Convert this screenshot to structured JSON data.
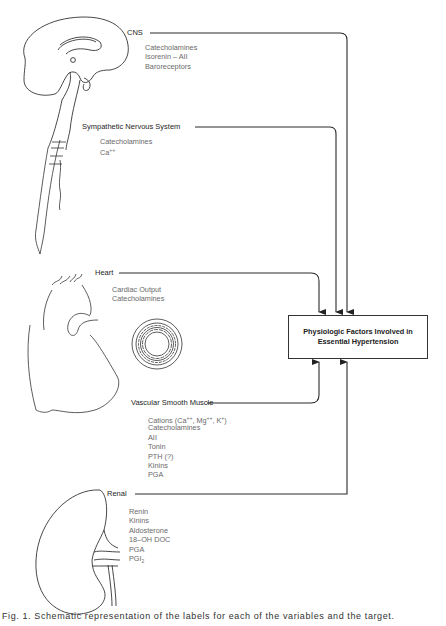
{
  "diagram": {
    "target": {
      "line1": "Physiologic Factors Involved in",
      "line2": "Essential Hypertension"
    },
    "sources": [
      {
        "label": "CNS",
        "items": [
          "Catecholamines",
          "Isorenin – AII",
          "Baroreceptors"
        ],
        "illustration": "brain-sagittal-section"
      },
      {
        "label": "Sympathetic Nervous System",
        "items": [
          "Catecholamines",
          "Ca++"
        ],
        "illustration": "spinal-cord"
      },
      {
        "label": "Heart",
        "items": [
          "Cardiac Output",
          "Catecholamines"
        ],
        "illustration": "heart"
      },
      {
        "label": "Vascular Smooth Muscle",
        "items": [
          "Cations (Ca++, Mg++, K+)",
          "Catecholamines",
          "AII",
          "Tonin",
          "PTH (?)",
          "Kinins",
          "PGA"
        ],
        "illustration": "vessel-cross-section"
      },
      {
        "label": "Renal",
        "items": [
          "Renin",
          "Kinins",
          "Aldosterone",
          "18–OH DOC",
          "PGA",
          "PGI2"
        ],
        "illustration": "kidney"
      }
    ],
    "caption": "Fig. 1. Schematic representation of the labels for each of the variables and the target."
  },
  "colors": {
    "line": "#2a2a2a",
    "label": "#1e1e1e",
    "item_text": "#6a6a6a",
    "background": "#ffffff"
  }
}
